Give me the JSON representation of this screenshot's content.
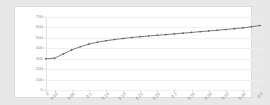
{
  "chart_data": {
    "type": "line",
    "title": "",
    "subtitle": "",
    "xlabel": "",
    "ylabel": "",
    "grid": true,
    "legend": false,
    "legend_position": "none",
    "xlim": [
      0,
      0.5
    ],
    "ylim": [
      0,
      700
    ],
    "y_ticks": [
      700,
      600,
      500,
      400,
      300,
      200,
      100,
      0
    ],
    "y_tick_labels": [
      "700",
      "600",
      "500",
      "400",
      "300",
      "200",
      "100",
      "0"
    ],
    "x_tick_labels": [
      "0",
      "0.02",
      "0.06",
      "0.1",
      "0.14",
      "0.18",
      "0.22",
      "0.26",
      "0.3",
      "0.34",
      "0.38",
      "0.42",
      "0.46",
      "0.5"
    ],
    "x_tick_values": [
      0,
      0.02,
      0.06,
      0.1,
      0.14,
      0.18,
      0.22,
      0.26,
      0.3,
      0.34,
      0.38,
      0.42,
      0.46,
      0.5
    ],
    "marker": "diamond",
    "series": [
      {
        "name": "series-1",
        "color": "#595959",
        "x": [
          0,
          0.02,
          0.04,
          0.06,
          0.08,
          0.1,
          0.12,
          0.14,
          0.16,
          0.18,
          0.2,
          0.22,
          0.24,
          0.26,
          0.28,
          0.3,
          0.32,
          0.34,
          0.36,
          0.38,
          0.4,
          0.42,
          0.44,
          0.46,
          0.48,
          0.5
        ],
        "values": [
          300,
          305,
          345,
          385,
          415,
          440,
          458,
          472,
          484,
          494,
          503,
          511,
          518,
          525,
          531,
          538,
          545,
          552,
          559,
          566,
          573,
          580,
          588,
          596,
          606,
          618
        ]
      }
    ]
  },
  "colors": {
    "page_background": "#e8e8e8",
    "plot_background": "#ffffff",
    "series_line": "#595959",
    "gridline": "#f0f0f0",
    "tick_label": "#8a8a8a"
  }
}
